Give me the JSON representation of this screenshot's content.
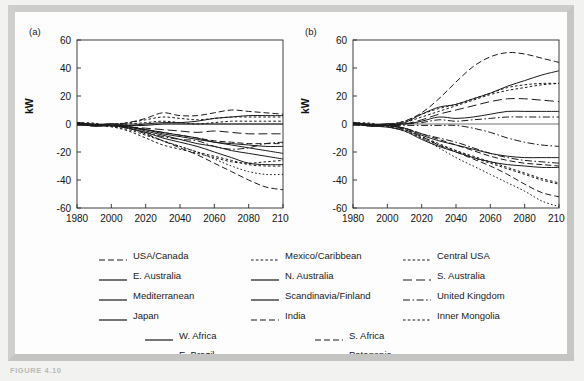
{
  "figure": {
    "caption_fragment": "FIGURE 4.10",
    "panels": [
      {
        "id": "a",
        "label": "(a)"
      },
      {
        "id": "b",
        "label": "(b)"
      }
    ]
  },
  "axes": {
    "ylabel": "kW",
    "yticks": [
      "60",
      "40",
      "20",
      "0",
      "-20",
      "-40",
      "-60"
    ],
    "ytick_values": [
      60,
      40,
      20,
      0,
      -20,
      -40,
      -60
    ],
    "ylim": [
      -60,
      60
    ],
    "xticks": [
      "1980",
      "2000",
      "2020",
      "2040",
      "2060",
      "2080",
      "2100"
    ],
    "xtick_values": [
      1980,
      2000,
      2020,
      2040,
      2060,
      2080,
      2100
    ],
    "xlim": [
      1980,
      2100
    ],
    "grid": false
  },
  "legend": {
    "position": "below-plots",
    "rows": [
      [
        {
          "label": "USA/Canada",
          "style": "dashed"
        },
        {
          "label": "Mexico/Caribbean",
          "style": "dotted-fine"
        },
        {
          "label": "Central USA",
          "style": "dotted-fine"
        }
      ],
      [
        {
          "label": "E. Australia",
          "style": "solid"
        },
        {
          "label": "N. Australia",
          "style": "solid"
        },
        {
          "label": "S. Australia",
          "style": "dashed-long"
        }
      ],
      [
        {
          "label": "Mediterranean",
          "style": "solid"
        },
        {
          "label": "Scandinavia/Finland",
          "style": "solid"
        },
        {
          "label": "United Kingdom",
          "style": "dash-dot"
        }
      ],
      [
        {
          "label": "Japan",
          "style": "solid"
        },
        {
          "label": "India",
          "style": "dashed"
        },
        {
          "label": "Inner Mongolia",
          "style": "dotted-fine"
        }
      ]
    ],
    "bottom_rows": [
      [
        {
          "label": "W. Africa",
          "style": "solid"
        },
        {
          "label": "S. Africa",
          "style": "dashed"
        }
      ],
      [
        {
          "label": "E. Brazil",
          "style": "dotted-fine"
        },
        {
          "label": "Patagonia",
          "style": "dotted"
        }
      ]
    ]
  },
  "colors": {
    "line": "#1a1a1a",
    "axis": "#2b2b2b",
    "page": "#f2f2f0",
    "frame": "#c9c9c7",
    "plot_background": "#ffffff"
  },
  "chart_data": [
    {
      "type": "line",
      "panel": "a",
      "title": "(a)",
      "xlabel": "",
      "ylabel": "kW",
      "xlim": [
        1980,
        2100
      ],
      "ylim": [
        -60,
        60
      ],
      "x": [
        1980,
        1990,
        2000,
        2010,
        2020,
        2030,
        2040,
        2050,
        2060,
        2070,
        2080,
        2090,
        2100
      ],
      "series": [
        {
          "name": "USA/Canada",
          "style": "dashed",
          "values": [
            1,
            0,
            -1,
            1,
            4,
            8,
            6,
            6,
            8,
            10,
            9,
            8,
            7
          ]
        },
        {
          "name": "Mexico/Caribbean",
          "style": "dotted-fine",
          "values": [
            0,
            -1,
            0,
            1,
            3,
            5,
            4,
            3,
            4,
            5,
            5,
            5,
            5
          ]
        },
        {
          "name": "Central USA",
          "style": "dotted-fine",
          "values": [
            0,
            0,
            -1,
            0,
            1,
            2,
            1,
            0,
            1,
            2,
            2,
            2,
            2
          ]
        },
        {
          "name": "E. Australia",
          "style": "solid",
          "values": [
            1,
            0,
            -1,
            -1,
            0,
            1,
            1,
            2,
            4,
            5,
            6,
            6,
            6
          ]
        },
        {
          "name": "N. Australia",
          "style": "solid",
          "values": [
            0,
            -1,
            0,
            -1,
            -1,
            0,
            0,
            0,
            0,
            0,
            0,
            0,
            0
          ]
        },
        {
          "name": "S. Australia",
          "style": "dashed-long",
          "values": [
            0,
            0,
            -1,
            -2,
            -3,
            -4,
            -5,
            -6,
            -5,
            -6,
            -7,
            -7,
            -7
          ]
        },
        {
          "name": "Mediterranean",
          "style": "solid",
          "values": [
            0,
            -1,
            -1,
            -2,
            -4,
            -6,
            -8,
            -10,
            -13,
            -14,
            -15,
            -16,
            -16
          ]
        },
        {
          "name": "Scandinavia/Finland",
          "style": "solid",
          "values": [
            1,
            0,
            -1,
            -2,
            -4,
            -7,
            -9,
            -11,
            -13,
            -15,
            -17,
            -19,
            -21
          ]
        },
        {
          "name": "United Kingdom",
          "style": "dash-dot",
          "values": [
            0,
            -1,
            -1,
            -3,
            -6,
            -9,
            -11,
            -12,
            -16,
            -18,
            -17,
            -14,
            -13
          ]
        },
        {
          "name": "Japan",
          "style": "solid",
          "values": [
            0,
            0,
            -1,
            -2,
            -5,
            -8,
            -11,
            -14,
            -16,
            -19,
            -21,
            -23,
            -25
          ]
        },
        {
          "name": "India",
          "style": "dashed",
          "values": [
            0,
            -1,
            -1,
            -2,
            -4,
            -6,
            -8,
            -10,
            -12,
            -13,
            -14,
            -14,
            -14
          ]
        },
        {
          "name": "Inner Mongolia",
          "style": "dotted-fine",
          "values": [
            1,
            0,
            -2,
            -4,
            -8,
            -12,
            -16,
            -20,
            -23,
            -26,
            -29,
            -30,
            -30
          ]
        },
        {
          "name": "W. Africa",
          "style": "solid",
          "values": [
            0,
            -1,
            -1,
            -3,
            -6,
            -10,
            -13,
            -16,
            -20,
            -24,
            -28,
            -29,
            -29
          ]
        },
        {
          "name": "S. Africa",
          "style": "dashed",
          "values": [
            0,
            0,
            -1,
            -3,
            -7,
            -12,
            -17,
            -22,
            -28,
            -34,
            -40,
            -45,
            -47
          ]
        },
        {
          "name": "E. Brazil",
          "style": "dotted-fine",
          "values": [
            0,
            -1,
            -2,
            -5,
            -10,
            -15,
            -18,
            -21,
            -24,
            -27,
            -28,
            -27,
            -26
          ]
        },
        {
          "name": "Patagonia",
          "style": "dotted",
          "values": [
            0,
            0,
            -1,
            -3,
            -7,
            -12,
            -16,
            -20,
            -25,
            -30,
            -34,
            -36,
            -36
          ]
        }
      ]
    },
    {
      "type": "line",
      "panel": "b",
      "title": "(b)",
      "xlabel": "",
      "ylabel": "kW",
      "xlim": [
        1980,
        2100
      ],
      "ylim": [
        -60,
        60
      ],
      "x": [
        1980,
        1990,
        2000,
        2010,
        2020,
        2030,
        2040,
        2050,
        2060,
        2070,
        2080,
        2090,
        2100
      ],
      "series": [
        {
          "name": "USA/Canada",
          "style": "dashed",
          "values": [
            1,
            0,
            -1,
            2,
            8,
            18,
            30,
            41,
            48,
            51,
            50,
            47,
            44
          ]
        },
        {
          "name": "Mexico/Caribbean",
          "style": "dotted-fine",
          "values": [
            0,
            -1,
            0,
            2,
            7,
            11,
            14,
            18,
            22,
            26,
            28,
            29,
            29
          ]
        },
        {
          "name": "Central USA",
          "style": "dotted-fine",
          "values": [
            0,
            0,
            -1,
            1,
            5,
            9,
            13,
            17,
            21,
            24,
            26,
            28,
            29
          ]
        },
        {
          "name": "E. Australia",
          "style": "solid",
          "values": [
            1,
            0,
            -1,
            1,
            7,
            12,
            14,
            18,
            22,
            27,
            31,
            35,
            38
          ]
        },
        {
          "name": "N. Australia",
          "style": "solid",
          "values": [
            0,
            -1,
            0,
            0,
            2,
            5,
            4,
            5,
            7,
            9,
            9,
            9,
            9
          ]
        },
        {
          "name": "S. Australia",
          "style": "dashed-long",
          "values": [
            0,
            0,
            -1,
            0,
            3,
            7,
            10,
            13,
            16,
            18,
            18,
            17,
            16
          ]
        },
        {
          "name": "Mediterranean",
          "style": "dash-dot",
          "values": [
            0,
            -1,
            -1,
            0,
            1,
            3,
            2,
            3,
            4,
            5,
            5,
            5,
            5
          ]
        },
        {
          "name": "Scandinavia/Finland",
          "style": "dash-dot",
          "values": [
            1,
            0,
            -1,
            -1,
            -1,
            -1,
            -1,
            -3,
            -6,
            -10,
            -13,
            -15,
            -16
          ]
        },
        {
          "name": "United Kingdom",
          "style": "dash-dot",
          "values": [
            0,
            -1,
            -1,
            -3,
            -7,
            -10,
            -13,
            -17,
            -21,
            -24,
            -26,
            -27,
            -28
          ]
        },
        {
          "name": "Japan",
          "style": "solid",
          "values": [
            0,
            0,
            -1,
            -3,
            -8,
            -12,
            -15,
            -18,
            -21,
            -23,
            -24,
            -24,
            -24
          ]
        },
        {
          "name": "India",
          "style": "dashed",
          "values": [
            0,
            -1,
            -1,
            -3,
            -7,
            -11,
            -15,
            -19,
            -23,
            -26,
            -28,
            -29,
            -30
          ]
        },
        {
          "name": "Inner Mongolia",
          "style": "dotted-fine",
          "values": [
            1,
            0,
            -2,
            -4,
            -9,
            -14,
            -19,
            -23,
            -27,
            -31,
            -35,
            -39,
            -42
          ]
        },
        {
          "name": "W. Africa",
          "style": "solid",
          "values": [
            0,
            -1,
            -2,
            -5,
            -11,
            -16,
            -20,
            -24,
            -27,
            -29,
            -30,
            -31,
            -31
          ]
        },
        {
          "name": "S. Africa",
          "style": "dashed",
          "values": [
            0,
            0,
            -1,
            -4,
            -9,
            -15,
            -20,
            -25,
            -30,
            -36,
            -43,
            -49,
            -52
          ]
        },
        {
          "name": "E. Brazil",
          "style": "dotted-fine",
          "values": [
            0,
            -1,
            -2,
            -5,
            -10,
            -15,
            -19,
            -24,
            -28,
            -32,
            -36,
            -40,
            -43
          ]
        },
        {
          "name": "Patagonia",
          "style": "dotted",
          "values": [
            0,
            0,
            -1,
            -4,
            -10,
            -17,
            -24,
            -30,
            -36,
            -42,
            -48,
            -55,
            -59
          ]
        }
      ]
    }
  ]
}
